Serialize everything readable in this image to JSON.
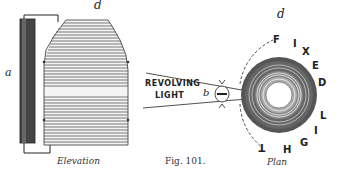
{
  "figure": {
    "number_caption": "Fig. 101.",
    "elevation": {
      "caption": "Elevation",
      "label_a": "a",
      "label_d": "d"
    },
    "plan": {
      "caption": "Plan",
      "label_d": "d",
      "label_b": "b",
      "revolving_light_line1": "REVOLVING",
      "revolving_light_line2": "LIGHT",
      "fixed_light_letters": [
        "F",
        "I",
        "X",
        "E",
        "D",
        "L",
        "I",
        "G",
        "H",
        "T"
      ]
    },
    "colors": {
      "ink": "#222222",
      "paper": "#ffffff",
      "shade": "#555555"
    }
  }
}
